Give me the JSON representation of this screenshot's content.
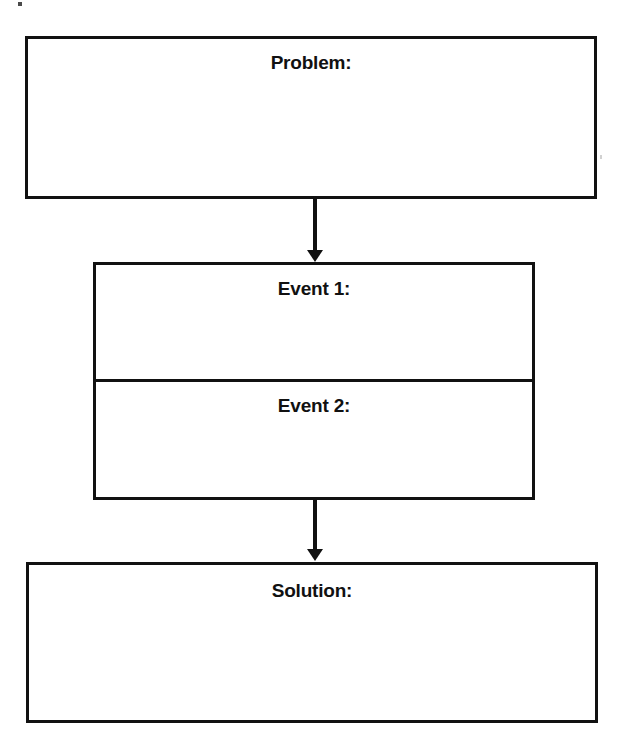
{
  "document": {
    "title": "Problem-Solution Graphic Organizer",
    "background_color": "#ffffff",
    "line_color": "#111111",
    "text_color": "#111111"
  },
  "diagram": {
    "type": "flowchart",
    "orientation": "vertical",
    "nodes": [
      {
        "id": "problem",
        "label": "Problem:",
        "kind": "writing-box",
        "content": ""
      },
      {
        "id": "event-1",
        "label": "Event 1:",
        "kind": "writing-box",
        "content": ""
      },
      {
        "id": "event-2",
        "label": "Event 2:",
        "kind": "writing-box",
        "content": ""
      },
      {
        "id": "solution",
        "label": "Solution:",
        "kind": "writing-box",
        "content": ""
      }
    ],
    "connectors": [
      {
        "id": "arrow-1",
        "from": "problem",
        "to": "event-1",
        "style": "solid-down-arrow"
      },
      {
        "id": "arrow-2",
        "from": "event-2",
        "to": "solution",
        "style": "solid-down-arrow"
      }
    ]
  }
}
